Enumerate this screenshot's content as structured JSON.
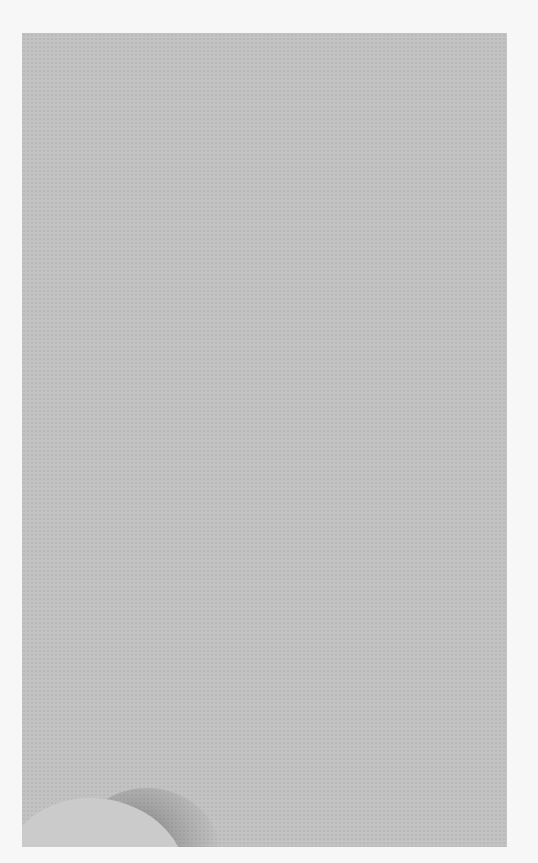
{
  "scene": {
    "description": "Gray textured paper sheet on white background with curled lower-left corner",
    "colors": {
      "background": "#f7f7f7",
      "paper": "#c2c2c2",
      "curl": "#cbcbcb",
      "shadow": "#5a5a5a"
    }
  }
}
